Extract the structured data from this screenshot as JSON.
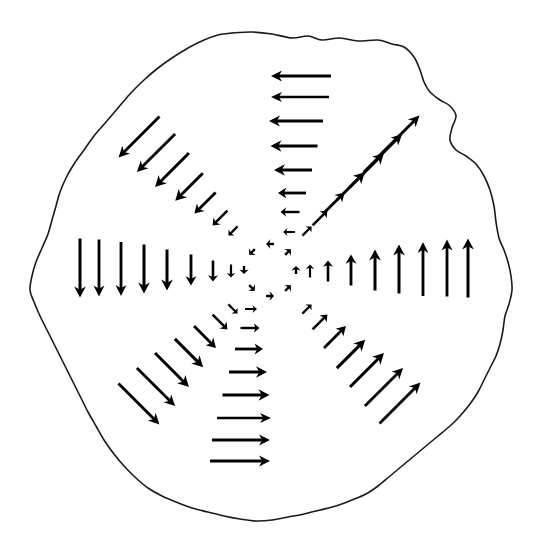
{
  "figure": {
    "background_color": "#ffffff",
    "ink_color": "#000000",
    "canvas": {
      "width": 533,
      "height": 536
    }
  },
  "boundary": {
    "name": "irregular-blob-outline",
    "stroke_color": "#1a1a1a",
    "stroke_width": 1.6,
    "style": "hand-drawn wobbly closed curve",
    "extent": {
      "left": 30,
      "right": 512,
      "top": 33,
      "bottom": 521
    },
    "points": [
      [
        232,
        33
      ],
      [
        252,
        32
      ],
      [
        272,
        34
      ],
      [
        292,
        38
      ],
      [
        308,
        36
      ],
      [
        322,
        40
      ],
      [
        340,
        38
      ],
      [
        358,
        41
      ],
      [
        378,
        40
      ],
      [
        392,
        44
      ],
      [
        404,
        47
      ],
      [
        414,
        57
      ],
      [
        420,
        70
      ],
      [
        424,
        82
      ],
      [
        430,
        92
      ],
      [
        440,
        100
      ],
      [
        450,
        106
      ],
      [
        456,
        116
      ],
      [
        452,
        128
      ],
      [
        450,
        140
      ],
      [
        456,
        150
      ],
      [
        466,
        156
      ],
      [
        476,
        164
      ],
      [
        484,
        176
      ],
      [
        490,
        190
      ],
      [
        494,
        206
      ],
      [
        496,
        222
      ],
      [
        499,
        238
      ],
      [
        504,
        250
      ],
      [
        508,
        262
      ],
      [
        511,
        276
      ],
      [
        512,
        290
      ],
      [
        509,
        304
      ],
      [
        505,
        316
      ],
      [
        503,
        330
      ],
      [
        500,
        344
      ],
      [
        496,
        356
      ],
      [
        490,
        368
      ],
      [
        484,
        380
      ],
      [
        478,
        392
      ],
      [
        470,
        404
      ],
      [
        460,
        416
      ],
      [
        450,
        426
      ],
      [
        438,
        436
      ],
      [
        426,
        446
      ],
      [
        414,
        456
      ],
      [
        402,
        466
      ],
      [
        390,
        476
      ],
      [
        378,
        486
      ],
      [
        366,
        494
      ],
      [
        352,
        500
      ],
      [
        336,
        506
      ],
      [
        320,
        510
      ],
      [
        304,
        514
      ],
      [
        288,
        517
      ],
      [
        272,
        520
      ],
      [
        256,
        521
      ],
      [
        240,
        519
      ],
      [
        224,
        516
      ],
      [
        208,
        512
      ],
      [
        192,
        508
      ],
      [
        176,
        502
      ],
      [
        162,
        496
      ],
      [
        148,
        488
      ],
      [
        136,
        478
      ],
      [
        124,
        466
      ],
      [
        114,
        454
      ],
      [
        104,
        440
      ],
      [
        96,
        426
      ],
      [
        88,
        412
      ],
      [
        80,
        396
      ],
      [
        72,
        380
      ],
      [
        64,
        364
      ],
      [
        56,
        348
      ],
      [
        48,
        332
      ],
      [
        40,
        316
      ],
      [
        34,
        302
      ],
      [
        30,
        290
      ],
      [
        32,
        276
      ],
      [
        36,
        262
      ],
      [
        42,
        248
      ],
      [
        48,
        234
      ],
      [
        52,
        220
      ],
      [
        56,
        206
      ],
      [
        60,
        192
      ],
      [
        66,
        178
      ],
      [
        74,
        164
      ],
      [
        84,
        150
      ],
      [
        94,
        136
      ],
      [
        106,
        122
      ],
      [
        118,
        108
      ],
      [
        130,
        94
      ],
      [
        144,
        80
      ],
      [
        158,
        68
      ],
      [
        172,
        58
      ],
      [
        188,
        48
      ],
      [
        204,
        40
      ],
      [
        218,
        35
      ],
      [
        232,
        33
      ]
    ]
  },
  "vector_field": {
    "name": "radial-arm-vector-field",
    "center": {
      "x": 270,
      "y": 270
    },
    "arm_count": 8,
    "description": "Eight arms radiating from the centre; on each arm the arrow direction is rotated 90 degrees counter-clockwise from the outward radial direction, and arrow length grows with distance from the centre.",
    "arrow_color": "#000000",
    "arms": [
      {
        "name": "arm-north",
        "radial_direction_deg": 270,
        "arrow_direction": "left",
        "arrow_direction_deg": 180,
        "arrows": [
          {
            "x": 289,
            "y": 232,
            "len": 12,
            "w": 2.0
          },
          {
            "x": 290,
            "y": 212,
            "len": 19,
            "w": 2.4
          },
          {
            "x": 292,
            "y": 193,
            "len": 28,
            "w": 2.8
          },
          {
            "x": 293,
            "y": 170,
            "len": 38,
            "w": 3.0
          },
          {
            "x": 294,
            "y": 146,
            "len": 47,
            "w": 3.0
          },
          {
            "x": 296,
            "y": 121,
            "len": 54,
            "w": 2.8
          },
          {
            "x": 300,
            "y": 97,
            "len": 58,
            "w": 2.6
          },
          {
            "x": 301,
            "y": 76,
            "len": 60,
            "w": 2.8
          }
        ]
      },
      {
        "name": "arm-northeast",
        "radial_direction_deg": 315,
        "arrow_direction": "up-right",
        "arrow_direction_deg": 45,
        "arrows": [
          {
            "x": 307,
            "y": 231,
            "len": 13,
            "w": 2.2
          },
          {
            "x": 320,
            "y": 218,
            "len": 21,
            "w": 2.6
          },
          {
            "x": 334,
            "y": 203,
            "len": 30,
            "w": 2.8
          },
          {
            "x": 351,
            "y": 186,
            "len": 39,
            "w": 3.0
          },
          {
            "x": 367,
            "y": 170,
            "len": 48,
            "w": 3.0
          },
          {
            "x": 383,
            "y": 153,
            "len": 54,
            "w": 2.8
          },
          {
            "x": 399,
            "y": 136,
            "len": 58,
            "w": 2.8
          }
        ]
      },
      {
        "name": "arm-east",
        "radial_direction_deg": 0,
        "arrow_direction": "up",
        "arrow_direction_deg": 90,
        "arrows": [
          {
            "x": 310,
            "y": 271,
            "len": 13,
            "w": 2.2
          },
          {
            "x": 328,
            "y": 271,
            "len": 21,
            "w": 2.6
          },
          {
            "x": 351,
            "y": 270,
            "len": 31,
            "w": 2.8
          },
          {
            "x": 375,
            "y": 270,
            "len": 41,
            "w": 3.0
          },
          {
            "x": 399,
            "y": 269,
            "len": 49,
            "w": 3.0
          },
          {
            "x": 423,
            "y": 269,
            "len": 54,
            "w": 2.8
          },
          {
            "x": 447,
            "y": 268,
            "len": 57,
            "w": 2.8
          },
          {
            "x": 468,
            "y": 268,
            "len": 59,
            "w": 3.0
          }
        ]
      },
      {
        "name": "arm-southeast",
        "radial_direction_deg": 45,
        "arrow_direction": "up-right",
        "arrow_direction_deg": 45,
        "arrows": [
          {
            "x": 307,
            "y": 309,
            "len": 13,
            "w": 2.2
          },
          {
            "x": 320,
            "y": 322,
            "len": 21,
            "w": 2.6
          },
          {
            "x": 335,
            "y": 337,
            "len": 31,
            "w": 2.8
          },
          {
            "x": 351,
            "y": 354,
            "len": 40,
            "w": 3.0
          },
          {
            "x": 367,
            "y": 370,
            "len": 48,
            "w": 3.0
          },
          {
            "x": 384,
            "y": 387,
            "len": 54,
            "w": 2.8
          },
          {
            "x": 400,
            "y": 403,
            "len": 58,
            "w": 2.8
          }
        ]
      },
      {
        "name": "arm-south",
        "radial_direction_deg": 90,
        "arrow_direction": "right",
        "arrow_direction_deg": 0,
        "arrows": [
          {
            "x": 251,
            "y": 309,
            "len": 12,
            "w": 2.0
          },
          {
            "x": 250,
            "y": 328,
            "len": 19,
            "w": 2.4
          },
          {
            "x": 249,
            "y": 349,
            "len": 28,
            "w": 2.8
          },
          {
            "x": 248,
            "y": 372,
            "len": 38,
            "w": 3.0
          },
          {
            "x": 246,
            "y": 395,
            "len": 47,
            "w": 3.0
          },
          {
            "x": 244,
            "y": 418,
            "len": 54,
            "w": 2.6
          },
          {
            "x": 241,
            "y": 440,
            "len": 58,
            "w": 2.8
          },
          {
            "x": 240,
            "y": 461,
            "len": 60,
            "w": 2.8
          }
        ]
      },
      {
        "name": "arm-southwest",
        "radial_direction_deg": 135,
        "arrow_direction": "down-right",
        "arrow_direction_deg": 315,
        "arrows": [
          {
            "x": 233,
            "y": 309,
            "len": 13,
            "w": 2.2
          },
          {
            "x": 220,
            "y": 322,
            "len": 21,
            "w": 2.6
          },
          {
            "x": 205,
            "y": 337,
            "len": 31,
            "w": 2.8
          },
          {
            "x": 189,
            "y": 353,
            "len": 40,
            "w": 3.0
          },
          {
            "x": 172,
            "y": 370,
            "len": 48,
            "w": 3.0
          },
          {
            "x": 156,
            "y": 387,
            "len": 54,
            "w": 2.8
          },
          {
            "x": 139,
            "y": 404,
            "len": 58,
            "w": 2.8
          }
        ]
      },
      {
        "name": "arm-west",
        "radial_direction_deg": 180,
        "arrow_direction": "down",
        "arrow_direction_deg": 270,
        "arrows": [
          {
            "x": 231,
            "y": 271,
            "len": 13,
            "w": 2.2
          },
          {
            "x": 213,
            "y": 271,
            "len": 21,
            "w": 2.6
          },
          {
            "x": 191,
            "y": 270,
            "len": 31,
            "w": 2.8
          },
          {
            "x": 167,
            "y": 270,
            "len": 41,
            "w": 3.0
          },
          {
            "x": 144,
            "y": 269,
            "len": 49,
            "w": 3.0
          },
          {
            "x": 121,
            "y": 269,
            "len": 54,
            "w": 2.8
          },
          {
            "x": 99,
            "y": 268,
            "len": 57,
            "w": 2.8
          },
          {
            "x": 80,
            "y": 268,
            "len": 59,
            "w": 3.0
          }
        ]
      },
      {
        "name": "arm-northwest",
        "radial_direction_deg": 225,
        "arrow_direction": "down-left",
        "arrow_direction_deg": 225,
        "arrows": [
          {
            "x": 233,
            "y": 231,
            "len": 13,
            "w": 2.2
          },
          {
            "x": 220,
            "y": 218,
            "len": 21,
            "w": 2.6
          },
          {
            "x": 205,
            "y": 203,
            "len": 30,
            "w": 2.8
          },
          {
            "x": 189,
            "y": 187,
            "len": 39,
            "w": 3.0
          },
          {
            "x": 172,
            "y": 170,
            "len": 48,
            "w": 3.0
          },
          {
            "x": 156,
            "y": 153,
            "len": 54,
            "w": 2.8
          },
          {
            "x": 139,
            "y": 137,
            "len": 58,
            "w": 2.8
          }
        ]
      }
    ],
    "inner_ring": {
      "name": "inner-ring-markers",
      "description": "Eight very small arrow marks forming a tight ring around the exact centre",
      "radius": 26,
      "markers": [
        {
          "x": 270,
          "y": 244,
          "angle_deg": 180,
          "len": 8,
          "w": 2.4
        },
        {
          "x": 288,
          "y": 252,
          "angle_deg": 45,
          "len": 8,
          "w": 2.4
        },
        {
          "x": 296,
          "y": 270,
          "angle_deg": 90,
          "len": 8,
          "w": 2.4
        },
        {
          "x": 288,
          "y": 288,
          "angle_deg": 45,
          "len": 8,
          "w": 2.4
        },
        {
          "x": 270,
          "y": 296,
          "angle_deg": 0,
          "len": 8,
          "w": 2.4
        },
        {
          "x": 252,
          "y": 288,
          "angle_deg": 315,
          "len": 8,
          "w": 2.4
        },
        {
          "x": 244,
          "y": 270,
          "angle_deg": 270,
          "len": 8,
          "w": 2.4
        },
        {
          "x": 252,
          "y": 252,
          "angle_deg": 225,
          "len": 8,
          "w": 2.4
        }
      ]
    }
  }
}
